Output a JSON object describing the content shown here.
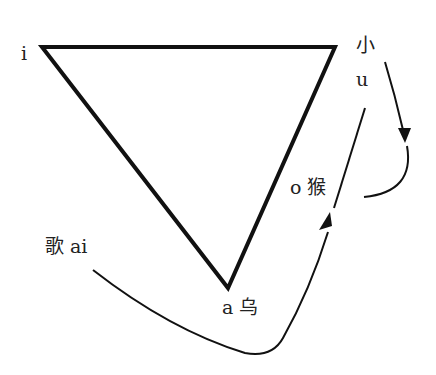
{
  "diagram": {
    "type": "vowel-triangle",
    "labels": {
      "i": "i",
      "xiao": "小",
      "u": "u",
      "o_hou": "o 猴",
      "ge_ai": "歌 ai",
      "a_wu": "a 乌"
    },
    "vertices": {
      "i": [
        42,
        47
      ],
      "top_right": [
        335,
        47
      ],
      "a": [
        228,
        288
      ]
    },
    "arrows": [
      {
        "name": "xiao-down-arrow",
        "from": "小",
        "to": "curve"
      },
      {
        "name": "ge-to-o-arrow",
        "from": "歌 ai",
        "to": "o 猴"
      }
    ],
    "colors": {
      "stroke": "#111111",
      "text": "#222222",
      "background": "#ffffff"
    }
  }
}
